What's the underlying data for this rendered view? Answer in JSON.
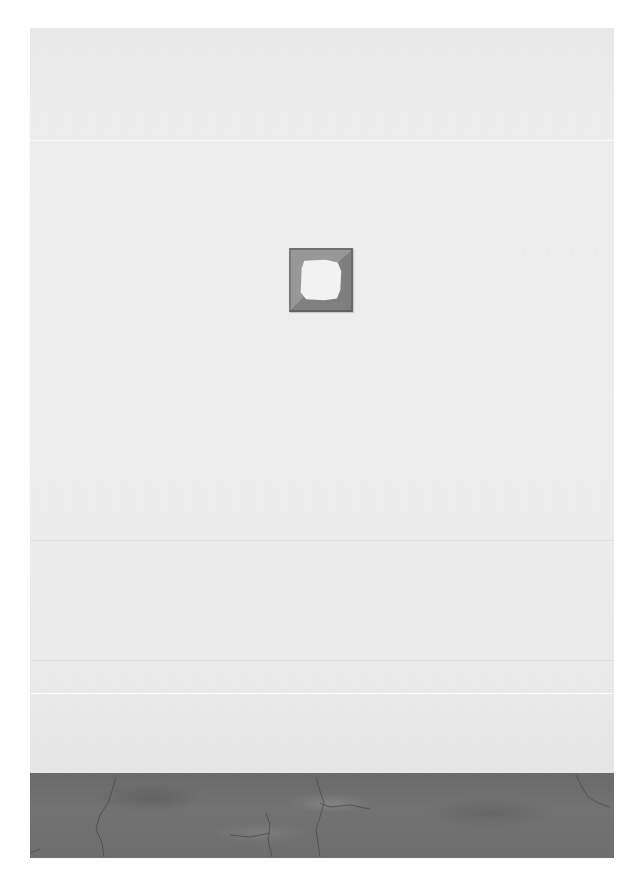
{
  "scene": {
    "description": "Gallery wall with a small square frame artwork above a cracked concrete floor",
    "colors": {
      "page_background": "#ffffff",
      "wall": "#ededed",
      "frame": "#8a8a8a",
      "frame_opening": "#f2f2f2",
      "floor": "#6e6e6e"
    }
  },
  "artwork": {
    "type": "square-frame",
    "opening_shape": "irregular-octagon"
  },
  "caption": {
    "text": ""
  }
}
